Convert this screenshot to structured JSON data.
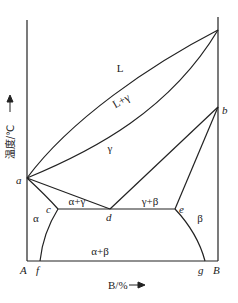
{
  "diagram": {
    "type": "binary phase diagram",
    "y_axis_label": "温度/℃",
    "x_axis_label": "B/%",
    "components": {
      "left": "A",
      "right": "B"
    },
    "points": {
      "a": "a",
      "b": "b",
      "c": "c",
      "d": "d",
      "e": "e",
      "f": "f",
      "g": "g"
    },
    "regions": {
      "liquid": "L",
      "liquid_gamma": "L+γ",
      "gamma": "γ",
      "alpha_gamma": "α+γ",
      "gamma_beta": "γ+β",
      "alpha": "α",
      "beta": "β",
      "alpha_beta": "α+β"
    }
  }
}
